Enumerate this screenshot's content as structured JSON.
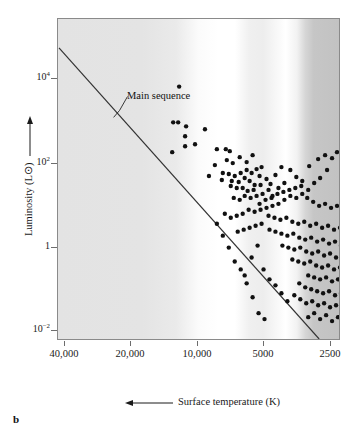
{
  "figure": {
    "letter": "b"
  },
  "axes": {
    "y": {
      "title": "Luminosity (L⊙)",
      "arrow_direction": "up",
      "ticks": [
        {
          "label_mantissa": "10",
          "label_exponent": "4",
          "value": 10000,
          "y_px": 78
        },
        {
          "label_mantissa": "10",
          "label_exponent": "2",
          "value": 100,
          "y_px": 163
        },
        {
          "label_mantissa": "1",
          "label_exponent": "",
          "value": 1,
          "y_px": 247
        },
        {
          "label_mantissa": "10",
          "label_exponent": "−2",
          "value": 0.01,
          "y_px": 330
        }
      ]
    },
    "x": {
      "title": "Surface temperature (K)",
      "arrow_direction": "left",
      "reversed": true,
      "ticks": [
        {
          "label": "40,000",
          "value": 40000,
          "x_px": 64
        },
        {
          "label": "20,000",
          "value": 20000,
          "x_px": 130
        },
        {
          "label": "10,000",
          "value": 10000,
          "x_px": 197
        },
        {
          "label": "5000",
          "value": 5000,
          "x_px": 263
        },
        {
          "label": "2500",
          "value": 2500,
          "x_px": 330
        }
      ]
    }
  },
  "annotations": [
    {
      "name": "main-sequence",
      "label": "Main sequence",
      "leader_from": [
        126,
        96
      ],
      "leader_to": [
        110,
        117
      ]
    }
  ],
  "colors": {
    "frame": "#8a8a8a",
    "point": "#111111",
    "line": "#333333",
    "text": "#1a1a1a",
    "background": "#ffffff",
    "band_hot": "#e0e0e0",
    "band_white": "#ffffff",
    "band_cool": "#c2c2c2"
  },
  "chart_data": {
    "type": "scatter",
    "xlabel": "Surface temperature (K)",
    "ylabel": "Luminosity (L⊙)",
    "xscale": "log-reversed",
    "yscale": "log",
    "xlim": [
      40000,
      2500
    ],
    "ylim": [
      0.001,
      100000
    ],
    "grid": false,
    "legend": "none",
    "spectral_bands": [
      {
        "class": "O-B",
        "x_start_px": 0,
        "x_end_px": 150,
        "shade": "#e2e2e2"
      },
      {
        "class": "A",
        "x_start_px": 150,
        "x_end_px": 190,
        "shade": "#ffffff"
      },
      {
        "class": "F-G",
        "x_start_px": 190,
        "x_end_px": 225,
        "shade": "#f2f2f2"
      },
      {
        "class": "G-K",
        "x_start_px": 225,
        "x_end_px": 250,
        "shade": "#ffffff"
      },
      {
        "class": "K",
        "x_start_px": 250,
        "x_end_px": 283,
        "shade": "#c8c8c8"
      }
    ],
    "main_sequence_line": {
      "name": "Main sequence",
      "x_px": [
        1,
        263
      ],
      "y_px": [
        29,
        322
      ]
    },
    "series": [
      {
        "name": "stars",
        "marker": "filled-circle",
        "marker_size_px": 3.4,
        "points_px": [
          [
            122,
            68
          ],
          [
            116,
            104
          ],
          [
            121,
            104
          ],
          [
            129,
            108
          ],
          [
            128,
            118
          ],
          [
            128,
            128
          ],
          [
            148,
            111
          ],
          [
            138,
            126
          ],
          [
            115,
            134
          ],
          [
            160,
            131
          ],
          [
            169,
            131
          ],
          [
            173,
            133
          ],
          [
            170,
            142
          ],
          [
            176,
            145
          ],
          [
            158,
            147
          ],
          [
            152,
            158
          ],
          [
            165,
            162
          ],
          [
            183,
            139
          ],
          [
            190,
            144
          ],
          [
            196,
            137
          ],
          [
            205,
            149
          ],
          [
            190,
            152
          ],
          [
            195,
            155
          ],
          [
            200,
            151
          ],
          [
            203,
            158
          ],
          [
            184,
            155
          ],
          [
            178,
            158
          ],
          [
            172,
            156
          ],
          [
            166,
            155
          ],
          [
            175,
            163
          ],
          [
            182,
            164
          ],
          [
            188,
            160
          ],
          [
            193,
            163
          ],
          [
            198,
            167
          ],
          [
            186,
            170
          ],
          [
            180,
            170
          ],
          [
            174,
            168
          ],
          [
            191,
            173
          ],
          [
            197,
            172
          ],
          [
            204,
            167
          ],
          [
            210,
            161
          ],
          [
            214,
            166
          ],
          [
            219,
            157
          ],
          [
            225,
            149
          ],
          [
            234,
            152
          ],
          [
            212,
            172
          ],
          [
            206,
            176
          ],
          [
            200,
            178
          ],
          [
            194,
            180
          ],
          [
            188,
            178
          ],
          [
            183,
            182
          ],
          [
            177,
            180
          ],
          [
            216,
            178
          ],
          [
            222,
            170
          ],
          [
            228,
            165
          ],
          [
            240,
            159
          ],
          [
            246,
            163
          ],
          [
            253,
            148
          ],
          [
            262,
            141
          ],
          [
            269,
            137
          ],
          [
            276,
            140
          ],
          [
            281,
            134
          ],
          [
            286,
            137
          ],
          [
            271,
            152
          ],
          [
            264,
            160
          ],
          [
            258,
            165
          ],
          [
            252,
            172
          ],
          [
            246,
            176
          ],
          [
            240,
            180
          ],
          [
            234,
            178
          ],
          [
            228,
            182
          ],
          [
            222,
            186
          ],
          [
            216,
            188
          ],
          [
            210,
            190
          ],
          [
            204,
            192
          ],
          [
            198,
            194
          ],
          [
            192,
            192
          ],
          [
            186,
            196
          ],
          [
            180,
            198
          ],
          [
            174,
            200
          ],
          [
            168,
            196
          ],
          [
            203,
            186
          ],
          [
            209,
            182
          ],
          [
            215,
            180
          ],
          [
            221,
            176
          ],
          [
            227,
            174
          ],
          [
            233,
            172
          ],
          [
            239,
            170
          ],
          [
            245,
            168
          ],
          [
            251,
            180
          ],
          [
            257,
            184
          ],
          [
            263,
            188
          ],
          [
            269,
            186
          ],
          [
            275,
            190
          ],
          [
            281,
            188
          ],
          [
            212,
            198
          ],
          [
            218,
            200
          ],
          [
            224,
            202
          ],
          [
            230,
            200
          ],
          [
            236,
            204
          ],
          [
            242,
            206
          ],
          [
            248,
            204
          ],
          [
            254,
            208
          ],
          [
            260,
            206
          ],
          [
            266,
            210
          ],
          [
            272,
            208
          ],
          [
            278,
            212
          ],
          [
            284,
            210
          ],
          [
            290,
            214
          ],
          [
            296,
            212
          ],
          [
            205,
            206
          ],
          [
            199,
            208
          ],
          [
            193,
            210
          ],
          [
            187,
            212
          ],
          [
            181,
            214
          ],
          [
            213,
            212
          ],
          [
            219,
            214
          ],
          [
            225,
            216
          ],
          [
            231,
            218
          ],
          [
            237,
            216
          ],
          [
            243,
            220
          ],
          [
            249,
            222
          ],
          [
            255,
            220
          ],
          [
            261,
            224
          ],
          [
            267,
            222
          ],
          [
            273,
            226
          ],
          [
            279,
            224
          ],
          [
            285,
            228
          ],
          [
            291,
            226
          ],
          [
            297,
            230
          ],
          [
            303,
            228
          ],
          [
            226,
            228
          ],
          [
            232,
            230
          ],
          [
            238,
            232
          ],
          [
            244,
            230
          ],
          [
            250,
            234
          ],
          [
            256,
            236
          ],
          [
            262,
            234
          ],
          [
            268,
            238
          ],
          [
            274,
            236
          ],
          [
            280,
            240
          ],
          [
            286,
            238
          ],
          [
            292,
            242
          ],
          [
            298,
            240
          ],
          [
            304,
            244
          ],
          [
            310,
            242
          ],
          [
            236,
            242
          ],
          [
            242,
            244
          ],
          [
            248,
            246
          ],
          [
            254,
            244
          ],
          [
            260,
            248
          ],
          [
            266,
            250
          ],
          [
            272,
            248
          ],
          [
            278,
            252
          ],
          [
            284,
            250
          ],
          [
            290,
            254
          ],
          [
            296,
            252
          ],
          [
            302,
            256
          ],
          [
            308,
            254
          ],
          [
            314,
            258
          ],
          [
            320,
            256
          ],
          [
            252,
            258
          ],
          [
            258,
            260
          ],
          [
            264,
            262
          ],
          [
            270,
            260
          ],
          [
            276,
            264
          ],
          [
            282,
            262
          ],
          [
            288,
            266
          ],
          [
            294,
            264
          ],
          [
            300,
            268
          ],
          [
            306,
            266
          ],
          [
            312,
            270
          ],
          [
            318,
            268
          ],
          [
            324,
            272
          ],
          [
            330,
            270
          ],
          [
            243,
            266
          ],
          [
            249,
            270
          ],
          [
            255,
            272
          ],
          [
            261,
            274
          ],
          [
            267,
            276
          ],
          [
            273,
            274
          ],
          [
            279,
            278
          ],
          [
            285,
            276
          ],
          [
            291,
            280
          ],
          [
            297,
            278
          ],
          [
            303,
            282
          ],
          [
            309,
            280
          ],
          [
            315,
            284
          ],
          [
            321,
            282
          ],
          [
            327,
            286
          ],
          [
            333,
            284
          ],
          [
            238,
            278
          ],
          [
            244,
            282
          ],
          [
            250,
            286
          ],
          [
            256,
            284
          ],
          [
            262,
            288
          ],
          [
            268,
            286
          ],
          [
            274,
            290
          ],
          [
            280,
            288
          ],
          [
            286,
            292
          ],
          [
            292,
            290
          ],
          [
            298,
            294
          ],
          [
            304,
            292
          ],
          [
            310,
            296
          ],
          [
            316,
            294
          ],
          [
            322,
            298
          ],
          [
            328,
            296
          ],
          [
            334,
            300
          ],
          [
            201,
            228
          ],
          [
            195,
            240
          ],
          [
            207,
            252
          ],
          [
            213,
            262
          ],
          [
            219,
            268
          ],
          [
            225,
            276
          ],
          [
            231,
            284
          ],
          [
            188,
            258
          ],
          [
            252,
            300
          ],
          [
            258,
            296
          ],
          [
            264,
            302
          ],
          [
            270,
            298
          ],
          [
            276,
            304
          ],
          [
            282,
            300
          ],
          [
            288,
            306
          ],
          [
            294,
            302
          ],
          [
            300,
            308
          ],
          [
            306,
            304
          ],
          [
            312,
            310
          ],
          [
            318,
            306
          ],
          [
            324,
            312
          ],
          [
            330,
            308
          ],
          [
            336,
            300
          ],
          [
            160,
            206
          ],
          [
            166,
            218
          ],
          [
            172,
            230
          ],
          [
            178,
            244
          ],
          [
            184,
            252
          ],
          [
            190,
            266
          ],
          [
            196,
            280
          ],
          [
            202,
            296
          ],
          [
            208,
            302
          ]
        ]
      }
    ]
  }
}
